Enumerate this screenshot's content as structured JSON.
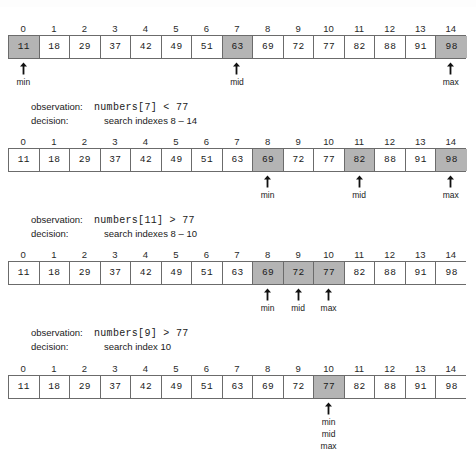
{
  "diagram": {
    "colors": {
      "shaded_cell": "#b4b4b4",
      "plain_cell": "#ffffff",
      "border": "#6b6b6b",
      "text": "#1a1a1a",
      "background": "#ffffff"
    },
    "indexes": [
      "0",
      "1",
      "2",
      "3",
      "4",
      "5",
      "6",
      "7",
      "8",
      "9",
      "10",
      "11",
      "12",
      "13",
      "14"
    ],
    "values": [
      "11",
      "18",
      "29",
      "37",
      "42",
      "49",
      "51",
      "63",
      "69",
      "72",
      "77",
      "82",
      "88",
      "91",
      "98"
    ],
    "steps": [
      {
        "name": "step-1",
        "shaded": [
          0,
          7,
          14
        ],
        "pointers": [
          {
            "index": 0,
            "labels": [
              "min"
            ]
          },
          {
            "index": 7,
            "labels": [
              "mid"
            ]
          },
          {
            "index": 14,
            "labels": [
              "max"
            ]
          }
        ],
        "note": {
          "observation_key": "observation:",
          "observation_value": "numbers[7] < 77",
          "decision_key": "decision:",
          "decision_value": "search indexes 8 – 14"
        }
      },
      {
        "name": "step-2",
        "shaded": [
          8,
          11,
          14
        ],
        "pointers": [
          {
            "index": 8,
            "labels": [
              "min"
            ]
          },
          {
            "index": 11,
            "labels": [
              "mid"
            ]
          },
          {
            "index": 14,
            "labels": [
              "max"
            ]
          }
        ],
        "note": {
          "observation_key": "observation:",
          "observation_value": "numbers[11] > 77",
          "decision_key": "decision:",
          "decision_value": "search indexes 8 – 10"
        }
      },
      {
        "name": "step-3",
        "shaded": [
          8,
          9,
          10
        ],
        "pointers": [
          {
            "index": 8,
            "labels": [
              "min"
            ]
          },
          {
            "index": 9,
            "labels": [
              "mid"
            ]
          },
          {
            "index": 10,
            "labels": [
              "max"
            ]
          }
        ],
        "note": {
          "observation_key": "observation:",
          "observation_value": "numbers[9] > 77",
          "decision_key": "decision:",
          "decision_value": "search index 10"
        }
      },
      {
        "name": "step-4",
        "shaded": [
          10
        ],
        "pointers": [
          {
            "index": 10,
            "labels": [
              "min",
              "mid",
              "max"
            ]
          }
        ],
        "note": null
      }
    ]
  }
}
